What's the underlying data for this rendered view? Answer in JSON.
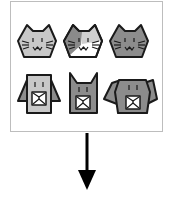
{
  "diagram": {
    "type": "animal-icon-grid-with-down-arrow",
    "box": {
      "border_color": "#bdbdbd"
    },
    "rows": [
      {
        "name": "cats-row",
        "items": [
          {
            "kind": "cat",
            "style": "light-gray",
            "fill": "#c8c8c8"
          },
          {
            "kind": "cat",
            "style": "calico",
            "fill": "#ffffff",
            "patch": "#8a8a8a"
          },
          {
            "kind": "cat",
            "style": "dark-gray",
            "fill": "#8c8c8c"
          }
        ]
      },
      {
        "name": "dogs-row",
        "items": [
          {
            "kind": "dog",
            "style": "light-gray-floppy-ears",
            "fill": "#c8c8c8",
            "ear_fill": "#8c8c8c"
          },
          {
            "kind": "cat-square",
            "style": "dark-gray",
            "fill": "#8c8c8c"
          },
          {
            "kind": "dog",
            "style": "dark-gray-wide-ears",
            "fill": "#8c8c8c",
            "ear_fill": "#8c8c8c"
          }
        ]
      }
    ],
    "arrow": {
      "direction": "down",
      "color": "#000000"
    }
  }
}
